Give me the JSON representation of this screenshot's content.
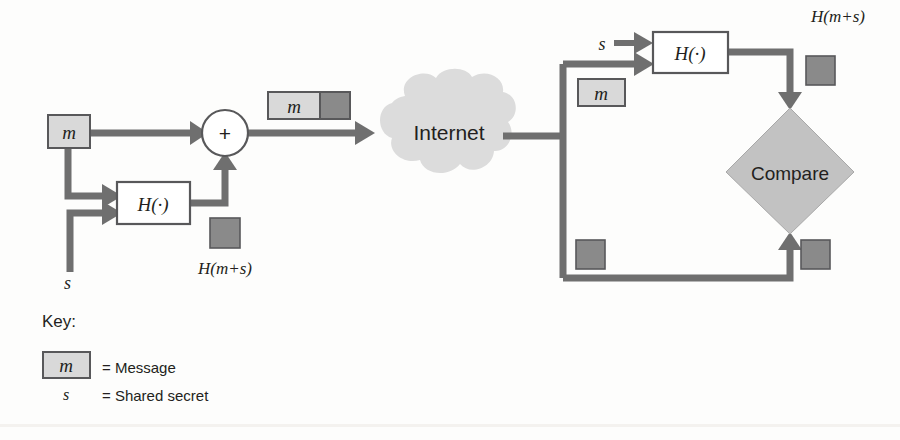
{
  "figure": {
    "background_color": "#fdfdfc",
    "line_color": "#6f6f6f",
    "box_fill": "#ffffff",
    "message_fill": "#d9d9d9",
    "hash_fill": "#8a8a8a",
    "cloud_fill": "#dcdcdc",
    "diamond_fill": "#c2c2c2"
  },
  "sender": {
    "message_box_label": "m",
    "secret_label": "s",
    "hash_function_label": "H(·)",
    "combiner_label": "+",
    "digest_label": "H(m+s)",
    "packet_message_label": "m"
  },
  "network": {
    "cloud_label": "Internet"
  },
  "receiver": {
    "secret_label": "s",
    "message_box_label": "m",
    "hash_function_label": "H(·)",
    "digest_label": "H(m+s)",
    "compare_label": "Compare"
  },
  "key": {
    "heading": "Key:",
    "entries": [
      {
        "symbol": "m",
        "equals": "= Message",
        "boxed": true
      },
      {
        "symbol": "s",
        "equals": "= Shared secret",
        "boxed": false
      }
    ]
  }
}
